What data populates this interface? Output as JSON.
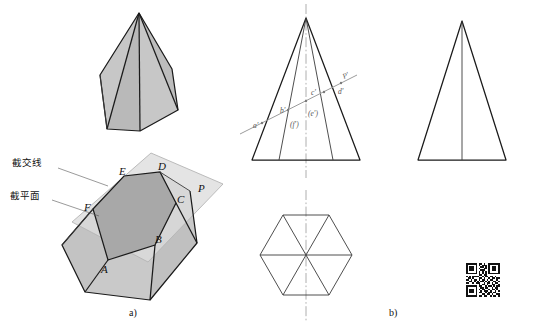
{
  "figure": {
    "title_caption_a": "a)",
    "title_caption_b": "b)"
  },
  "annotations": {
    "intersection_line": "截交线",
    "cutting_plane": "截平面"
  },
  "pictorial": {
    "vertex_labels": [
      "A",
      "B",
      "C",
      "D",
      "E",
      "F"
    ],
    "plane_label": "P",
    "vertex_positions": [
      {
        "label": "A",
        "x": 108,
        "y": 260
      },
      {
        "label": "B",
        "x": 155,
        "y": 245
      },
      {
        "label": "C",
        "x": 176,
        "y": 203
      },
      {
        "label": "D",
        "x": 160,
        "y": 172
      },
      {
        "label": "E",
        "x": 124,
        "y": 176
      },
      {
        "label": "F",
        "x": 93,
        "y": 209
      }
    ]
  },
  "front_view": {
    "labels": [
      "a'",
      "b'",
      "(f')",
      "(e')",
      "c'",
      "d'",
      "P'"
    ],
    "label_positions": [
      {
        "text": "a'",
        "x": 257,
        "y": 124
      },
      {
        "text": "b'",
        "x": 282,
        "y": 112
      },
      {
        "text": "(f')",
        "x": 292,
        "y": 125
      },
      {
        "text": "(e')",
        "x": 310,
        "y": 113
      },
      {
        "text": "c'",
        "x": 311,
        "y": 97
      },
      {
        "text": "d'",
        "x": 340,
        "y": 93
      },
      {
        "text": "P'",
        "x": 345,
        "y": 77
      }
    ]
  },
  "top_view": {
    "shape": "hexagon",
    "diagonals": 3,
    "centerlines": [
      "vertical",
      "horizontal"
    ]
  },
  "side_view": {
    "shape": "triangle",
    "center_edge": true
  },
  "colors": {
    "cut_section_fill": "#a8a8a8",
    "plane_fill": "#dcdcdc",
    "solid_face_light": "#c8c8c8",
    "solid_face_mid": "#bdbdbd",
    "outline": "#1a1a1a",
    "thin_line": "#3a3a3a",
    "centerline": "#9a9a9a"
  },
  "qr_code": {
    "present": true,
    "modules": 21,
    "pattern": [
      "111111101101001111111",
      "100000101011101000001",
      "101110100110101011101",
      "101110101001101011101",
      "101110100111001011101",
      "100000101010101000001",
      "111111101010101111111",
      "000000001101100000000",
      "101011110010110110100",
      "011010001101001011011",
      "110101101011010110010",
      "001101010110101001101",
      "110010111001011010110",
      "000000001011010011001",
      "111111101100101101011",
      "100000100110110010110",
      "101110101011001011010",
      "101110100101110100101",
      "101110101100101101100",
      "100000100011011010011",
      "111111101101100101101"
    ]
  }
}
